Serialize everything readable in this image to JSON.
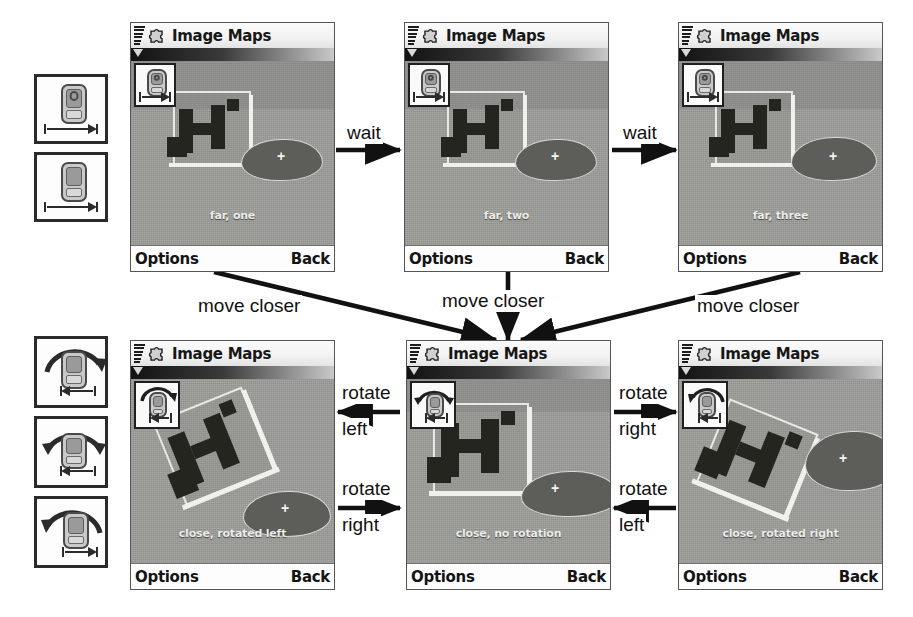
{
  "diagram": {
    "app_name": "Image Maps",
    "softkey_left": "Options",
    "softkey_right": "Back"
  },
  "legend": {
    "top_group": [
      {
        "name": "distance-far-icon",
        "description": "phone held far, arrow pointing right"
      },
      {
        "name": "distance-near-icon",
        "description": "phone held near, arrow pointing right"
      }
    ],
    "bottom_group": [
      {
        "name": "rotate-left-icon",
        "description": "phone with arc arrow curving right"
      },
      {
        "name": "rotate-none-icon",
        "description": "phone with arc arrows both directions"
      },
      {
        "name": "rotate-right-icon",
        "description": "phone with arc arrow curving left"
      }
    ]
  },
  "screens": [
    {
      "id": "far-one",
      "caption": "far, one",
      "badge": "distance-icon",
      "rotation": 0
    },
    {
      "id": "far-two",
      "caption": "far, two",
      "badge": "distance-icon",
      "rotation": 0
    },
    {
      "id": "far-three",
      "caption": "far, three",
      "badge": "distance-icon",
      "rotation": 0
    },
    {
      "id": "close-rotated-left",
      "caption": "close, rotated left",
      "badge": "rotate-icon",
      "rotation": -22
    },
    {
      "id": "close-no-rotation",
      "caption": "close, no rotation",
      "badge": "rotate-icon",
      "rotation": 0
    },
    {
      "id": "close-rotated-right",
      "caption": "close, rotated right",
      "badge": "rotate-icon",
      "rotation": 22
    }
  ],
  "transitions": [
    {
      "id": "wait-1",
      "label": "wait",
      "from": "far-one",
      "to": "far-two"
    },
    {
      "id": "wait-2",
      "label": "wait",
      "from": "far-two",
      "to": "far-three"
    },
    {
      "id": "closer-1",
      "label": "move closer",
      "from": "far-one",
      "to": "close-no-rotation"
    },
    {
      "id": "closer-2",
      "label": "move closer",
      "from": "far-two",
      "to": "close-no-rotation"
    },
    {
      "id": "closer-3",
      "label": "move closer",
      "from": "far-three",
      "to": "close-no-rotation"
    },
    {
      "id": "rot-left-1",
      "label_line1": "rotate",
      "label_line2": "left",
      "from": "close-no-rotation",
      "to": "close-rotated-left"
    },
    {
      "id": "rot-right-1",
      "label_line1": "rotate",
      "label_line2": "right",
      "from": "close-rotated-left",
      "to": "close-no-rotation"
    },
    {
      "id": "rot-right-2",
      "label_line1": "rotate",
      "label_line2": "right",
      "from": "close-no-rotation",
      "to": "close-rotated-right"
    },
    {
      "id": "rot-left-2",
      "label_line1": "rotate",
      "label_line2": "left",
      "from": "close-rotated-right",
      "to": "close-no-rotation"
    }
  ],
  "colors": {
    "ink": "#111111",
    "page": "#ffffff",
    "map_gray": "#9fa09c",
    "titlebar": "#f5f5f5"
  }
}
